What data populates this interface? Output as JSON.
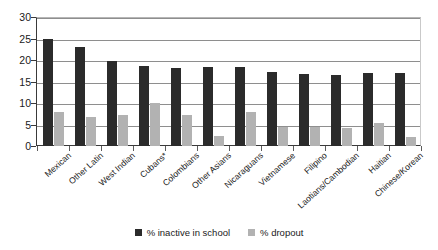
{
  "chart_data": {
    "type": "bar",
    "title": "",
    "subtitle": "",
    "xlabel": "",
    "ylabel": "",
    "ylim": [
      0,
      30
    ],
    "yticks": [
      0,
      5,
      10,
      15,
      20,
      25,
      30
    ],
    "grid": true,
    "legend_position": "bottom",
    "categories": [
      "Mexican",
      "Other Latin",
      "West Indian",
      "Cubans*",
      "Colombians",
      "Other Asians",
      "Nicaraguans",
      "Vietnamese",
      "Filipino",
      "Laotians/Cambodian",
      "Haitian",
      "Chinese/Korean"
    ],
    "series": [
      {
        "name": "% inactive in school",
        "color": "#2b2b2b",
        "values": [
          25.0,
          23.0,
          19.8,
          18.7,
          18.1,
          18.3,
          18.3,
          17.3,
          16.7,
          16.4,
          16.9,
          16.9
        ]
      },
      {
        "name": "% dropout",
        "color": "#b2b2b2",
        "values": [
          8.0,
          6.8,
          7.2,
          10.0,
          7.3,
          2.4,
          8.0,
          4.5,
          4.5,
          4.3,
          5.3,
          2.1
        ]
      }
    ]
  },
  "legend": {
    "items": [
      {
        "label": "% inactive in school"
      },
      {
        "label": "% dropout"
      }
    ]
  },
  "axis": {
    "y_tick_labels": [
      "0",
      "5",
      "10",
      "15",
      "20",
      "25",
      "30"
    ]
  }
}
